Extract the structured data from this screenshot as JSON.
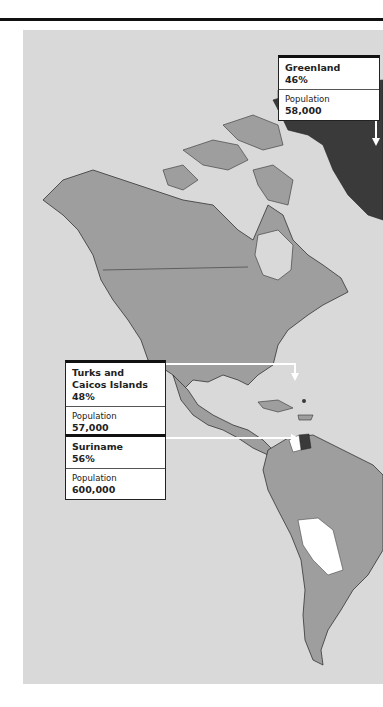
{
  "map": {
    "region": "Americas",
    "colors": {
      "ocean": "#d9d9d9",
      "land": "#9e9e9e",
      "highlight_dark": "#3a3a3a",
      "highlight_white": "#ffffff",
      "border": "#333333"
    }
  },
  "callouts": [
    {
      "name": "Greenland",
      "percent": "46%",
      "population_label": "Population",
      "population": "58,000"
    },
    {
      "name": "Turks and Caicos Islands",
      "percent": "48%",
      "population_label": "Population",
      "population": "57,000"
    },
    {
      "name": "Suriname",
      "percent": "56%",
      "population_label": "Population",
      "population": "600,000"
    }
  ]
}
